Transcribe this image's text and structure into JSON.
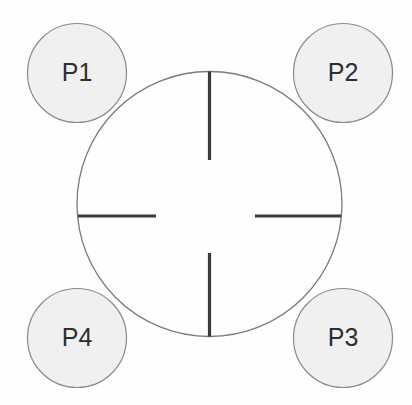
{
  "figure": {
    "type": "schematic-diagram",
    "background_color": "#fefefe",
    "width": 412,
    "height": 405
  },
  "colors": {
    "node_fill": "#f0f0f0",
    "node_stroke": "#8a8a8a",
    "main_circle_stroke": "#7a7a7a",
    "crosshair_color": "#3a3a3a",
    "label_color": "#2e2e2e"
  },
  "main_circle": {
    "name": "central-circle",
    "cx": 209.5,
    "cy": 204,
    "r": 132.5,
    "stroke_width": 1.3,
    "fill": "none"
  },
  "crosshair": {
    "name": "crosshair-marks",
    "stroke_width": 3.2,
    "segments": [
      {
        "name": "crosshair-top-tick",
        "x1": 209.5,
        "y1": 71.5,
        "x2": 209.5,
        "y2": 160
      },
      {
        "name": "crosshair-bottom-tick",
        "x1": 209.5,
        "y1": 253,
        "x2": 209.5,
        "y2": 336.5
      },
      {
        "name": "crosshair-left-tick",
        "x1": 78,
        "y1": 216,
        "x2": 156,
        "y2": 216
      },
      {
        "name": "crosshair-right-tick",
        "x1": 255,
        "y1": 216,
        "x2": 341,
        "y2": 216
      }
    ]
  },
  "nodes": [
    {
      "id": "p1",
      "label": "P1",
      "cx": 77,
      "cy": 73,
      "r": 49.5,
      "position": "top-left"
    },
    {
      "id": "p2",
      "label": "P2",
      "cx": 343,
      "cy": 73,
      "r": 49.5,
      "position": "top-right"
    },
    {
      "id": "p3",
      "label": "P3",
      "cx": 343,
      "cy": 338,
      "r": 49.5,
      "position": "bottom-right"
    },
    {
      "id": "p4",
      "label": "P4",
      "cx": 77,
      "cy": 338,
      "r": 49.5,
      "position": "bottom-left"
    }
  ]
}
